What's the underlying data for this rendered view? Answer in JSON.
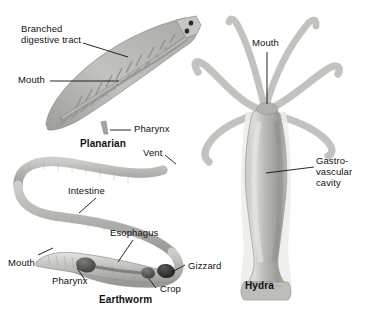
{
  "figure": {
    "background_color": "#ffffff",
    "line_color": "#111111",
    "organism_fill_light": "#d8d8d6",
    "organism_fill_mid": "#b3b3b0",
    "organism_fill_dark": "#8a8a87",
    "organ_dark": "#4a4a48"
  },
  "planarian": {
    "name": "Planarian",
    "labels": {
      "branched_line1": "Branched",
      "branched_line2": "digestive tract",
      "mouth": "Mouth",
      "pharynx": "Pharynx"
    }
  },
  "earthworm": {
    "name": "Earthworm",
    "labels": {
      "vent": "Vent",
      "intestine": "Intestine",
      "esophagus": "Esophagus",
      "mouth": "Mouth",
      "pharynx": "Pharynx",
      "crop": "Crop",
      "gizzard": "Gizzard"
    }
  },
  "hydra": {
    "name": "Hydra",
    "labels": {
      "mouth": "Mouth",
      "cavity_line1": "Gastro-",
      "cavity_line2": "vascular",
      "cavity_line3": "cavity"
    },
    "tentacle_count": 6
  }
}
